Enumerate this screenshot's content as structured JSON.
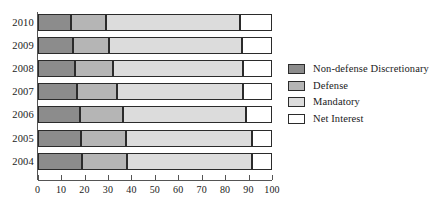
{
  "chart_data": {
    "type": "bar",
    "orientation": "horizontal",
    "stacked": true,
    "title": "",
    "subtitle": "",
    "xlabel": "",
    "ylabel": "",
    "xlim": [
      0,
      100
    ],
    "xticks": [
      0,
      10,
      20,
      30,
      40,
      50,
      60,
      70,
      80,
      90,
      100
    ],
    "xtick_labels": [
      "0",
      "10",
      "20",
      "30",
      "40",
      "50",
      "60",
      "70",
      "80",
      "90",
      "100"
    ],
    "grid": false,
    "legend_position": "right",
    "categories": [
      "2010",
      "2009",
      "2008",
      "2007",
      "2006",
      "2005",
      "2004"
    ],
    "series": [
      {
        "name": "Non-defense Discretionary",
        "color": "#8c8c8c",
        "values": [
          14.2,
          14.9,
          15.9,
          16.6,
          18.0,
          18.5,
          19.0
        ]
      },
      {
        "name": "Defense",
        "color": "#b5b5b5",
        "values": [
          14.8,
          15.5,
          16.4,
          17.1,
          18.3,
          19.0,
          19.0
        ]
      },
      {
        "name": "Mandatory",
        "color": "#dcdcdc",
        "values": [
          57.3,
          56.7,
          55.2,
          54.1,
          52.7,
          53.8,
          53.3
        ]
      },
      {
        "name": "Net Interest",
        "color": "#ffffff",
        "values": [
          13.7,
          12.9,
          12.5,
          12.2,
          11.0,
          8.7,
          8.7
        ]
      }
    ]
  },
  "legend": {
    "items": [
      {
        "label": "Non-defense Discretionary",
        "color": "#8c8c8c"
      },
      {
        "label": "Defense",
        "color": "#b5b5b5"
      },
      {
        "label": "Mandatory",
        "color": "#dcdcdc"
      },
      {
        "label": "Net Interest",
        "color": "#ffffff"
      }
    ]
  },
  "axis": {
    "tick_labels": [
      "0",
      "10",
      "20",
      "30",
      "40",
      "50",
      "60",
      "70",
      "80",
      "90",
      "100"
    ]
  },
  "bars": [
    {
      "year": "2010"
    },
    {
      "year": "2009"
    },
    {
      "year": "2008"
    },
    {
      "year": "2007"
    },
    {
      "year": "2006"
    },
    {
      "year": "2005"
    },
    {
      "year": "2004"
    }
  ]
}
